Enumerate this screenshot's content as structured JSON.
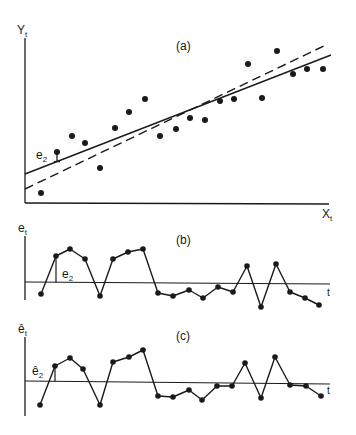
{
  "figure": {
    "background": "#ffffff",
    "ink": "#1a1a1a"
  },
  "chart_data": [
    {
      "panel": "(a)",
      "type": "scatter",
      "title": "(a)",
      "xlabel": "X",
      "xlabel_sub": "t",
      "ylabel": "Y",
      "ylabel_sub": "t",
      "grid": false,
      "annotation": {
        "label": "e",
        "label_sub": "2",
        "point_index": 1,
        "description": "vertical residual from point 2 to solid fitted line"
      },
      "points_px": [
        [
          41,
          193
        ],
        [
          57,
          152
        ],
        [
          72,
          136
        ],
        [
          85,
          143
        ],
        [
          100,
          168
        ],
        [
          115,
          128
        ],
        [
          129,
          112
        ],
        [
          145,
          99
        ],
        [
          160,
          136
        ],
        [
          176,
          129
        ],
        [
          190,
          118
        ],
        [
          205,
          120
        ],
        [
          220,
          101
        ],
        [
          234,
          99
        ],
        [
          248,
          64
        ],
        [
          262,
          98
        ],
        [
          277,
          51
        ],
        [
          293,
          74
        ],
        [
          307,
          69
        ],
        [
          323,
          69
        ]
      ],
      "series": [
        {
          "name": "observations Y_t",
          "style": "dots",
          "x": [
            1,
            2,
            3,
            4,
            5,
            6,
            7,
            8,
            9,
            10,
            11,
            12,
            13,
            14,
            15,
            16,
            17,
            18,
            19,
            20
          ],
          "values": [
            10,
            51,
            67,
            60,
            35,
            75,
            91,
            104,
            67,
            74,
            85,
            83,
            102,
            104,
            139,
            105,
            152,
            129,
            134,
            134
          ]
        },
        {
          "name": "fitted regression line",
          "style": "solid",
          "x0": 0,
          "y0": 29,
          "x1": 20.5,
          "y1": 148
        },
        {
          "name": "true regression line",
          "style": "dashed",
          "x0": 0,
          "y0": 14,
          "x1": 20.3,
          "y1": 159
        }
      ],
      "lines_px": {
        "solid": [
          [
            25,
            174
          ],
          [
            331,
            55
          ]
        ],
        "dashed": [
          [
            25,
            189
          ],
          [
            328,
            44
          ]
        ]
      }
    },
    {
      "panel": "(b)",
      "type": "line",
      "title": "(b)",
      "xlabel": "t",
      "ylabel": "e",
      "ylabel_sub": "t",
      "grid": false,
      "zero_line": true,
      "annotation": {
        "label": "e",
        "label_sub": "2",
        "point_index": 1
      },
      "x": [
        1,
        2,
        3,
        4,
        5,
        6,
        7,
        8,
        9,
        10,
        11,
        12,
        13,
        14,
        15,
        16,
        17,
        18,
        19,
        20
      ],
      "values": [
        -12,
        26,
        33,
        23,
        -14,
        23,
        30,
        34,
        -11,
        -14,
        -8,
        -16,
        -5,
        -10,
        17,
        -24,
        19,
        -9,
        -15,
        -22
      ],
      "points_px": [
        [
          41,
          294
        ],
        [
          56,
          256
        ],
        [
          70,
          249
        ],
        [
          85,
          259
        ],
        [
          100,
          296
        ],
        [
          113,
          259
        ],
        [
          128,
          252
        ],
        [
          143,
          249
        ],
        [
          158,
          293
        ],
        [
          173,
          296
        ],
        [
          189,
          290
        ],
        [
          203,
          298
        ],
        [
          218,
          287
        ],
        [
          233,
          292
        ],
        [
          247,
          266
        ],
        [
          261,
          307
        ],
        [
          276,
          264
        ],
        [
          290,
          292
        ],
        [
          305,
          298
        ],
        [
          319,
          305
        ]
      ]
    },
    {
      "panel": "(c)",
      "type": "line",
      "title": "(c)",
      "xlabel": "t",
      "ylabel": "ê",
      "ylabel_sub": "t",
      "grid": false,
      "zero_line": true,
      "annotation": {
        "label": "ê",
        "label_sub": "2",
        "point_index": 1
      },
      "x": [
        1,
        2,
        3,
        4,
        5,
        6,
        7,
        8,
        9,
        10,
        11,
        12,
        13,
        14,
        15,
        16,
        17,
        18,
        19,
        20
      ],
      "values": [
        -23,
        16,
        24,
        13,
        -23,
        20,
        25,
        32,
        -14,
        -15,
        -8,
        -18,
        -4,
        -4,
        19,
        -16,
        25,
        -3,
        -4,
        -14
      ],
      "points_px": [
        [
          40,
          405
        ],
        [
          55,
          366
        ],
        [
          70,
          358
        ],
        [
          83,
          369
        ],
        [
          100,
          405
        ],
        [
          113,
          362
        ],
        [
          129,
          357
        ],
        [
          143,
          350
        ],
        [
          158,
          396
        ],
        [
          173,
          397
        ],
        [
          189,
          390
        ],
        [
          202,
          400
        ],
        [
          217,
          386
        ],
        [
          232,
          386
        ],
        [
          245,
          363
        ],
        [
          261,
          398
        ],
        [
          275,
          357
        ],
        [
          290,
          385
        ],
        [
          306,
          386
        ],
        [
          321,
          396
        ]
      ]
    }
  ],
  "labels": {
    "a": {
      "title": "(a)",
      "y": "Y",
      "y_sub": "t",
      "x": "X",
      "x_sub": "t",
      "ann": "e",
      "ann_sub": "2"
    },
    "b": {
      "title": "(b)",
      "y": "e",
      "y_sub": "t",
      "x": "t",
      "ann": "e",
      "ann_sub": "2"
    },
    "c": {
      "title": "(c)",
      "y": "ê",
      "y_sub": "t",
      "x": "t",
      "ann": "ê",
      "ann_sub": "2"
    }
  }
}
